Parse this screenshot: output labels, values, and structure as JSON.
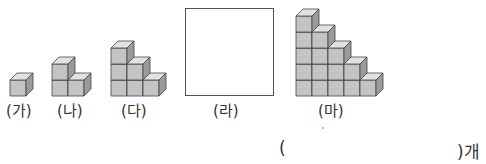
{
  "figures": [
    {
      "id": "ga",
      "label": "(가)",
      "columns": [
        1
      ]
    },
    {
      "id": "na",
      "label": "(나)",
      "columns": [
        2,
        1
      ]
    },
    {
      "id": "da",
      "label": "(다)",
      "columns": [
        3,
        2,
        1
      ]
    },
    {
      "id": "ra",
      "label": "(라)",
      "columns": []
    },
    {
      "id": "ma",
      "label": "(마)",
      "columns": [
        5,
        4,
        3,
        2,
        1
      ]
    }
  ],
  "answer": {
    "open_paren": "(",
    "close_unit": ")개",
    "value": ""
  },
  "colors": {
    "cube_front": "#c4c4c4",
    "cube_top": "#e2e2e2",
    "cube_side": "#9a9a9a",
    "cube_edge": "#444444"
  }
}
